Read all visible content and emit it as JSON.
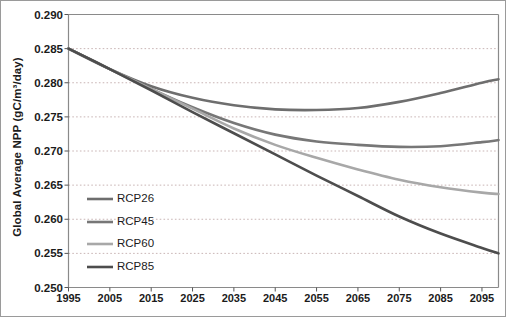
{
  "chart_data": {
    "type": "line",
    "title": "",
    "xlabel": "",
    "ylabel": "Global Average NPP (gC/m³/day)",
    "xlim": [
      1995,
      2099
    ],
    "ylim": [
      0.25,
      0.29
    ],
    "grid": true,
    "legend_position": "inside-lower-left",
    "x_ticks": [
      "1995",
      "2005",
      "2015",
      "2025",
      "2035",
      "2045",
      "2055",
      "2065",
      "2075",
      "2085",
      "2095"
    ],
    "y_ticks": [
      "0.250",
      "0.255",
      "0.260",
      "0.265",
      "0.270",
      "0.275",
      "0.280",
      "0.285",
      "0.290"
    ],
    "x": [
      1995,
      2005,
      2015,
      2025,
      2035,
      2045,
      2055,
      2065,
      2075,
      2085,
      2095,
      2099
    ],
    "series": [
      {
        "name": "RCP26",
        "color": "#6e6e6e",
        "values": [
          0.285,
          0.282,
          0.2795,
          0.2778,
          0.2767,
          0.2761,
          0.276,
          0.2763,
          0.2772,
          0.2785,
          0.28,
          0.2805
        ]
      },
      {
        "name": "RCP45",
        "color": "#777777",
        "values": [
          0.285,
          0.282,
          0.2791,
          0.2764,
          0.2741,
          0.2724,
          0.2714,
          0.2709,
          0.2706,
          0.2707,
          0.2713,
          0.2716
        ]
      },
      {
        "name": "RCP60",
        "color": "#a8a8a8",
        "values": [
          0.285,
          0.282,
          0.2791,
          0.2762,
          0.2733,
          0.2709,
          0.269,
          0.2673,
          0.2658,
          0.2647,
          0.2639,
          0.2637
        ]
      },
      {
        "name": "RCP85",
        "color": "#4d4d4d",
        "values": [
          0.285,
          0.282,
          0.2789,
          0.2757,
          0.2726,
          0.2695,
          0.2664,
          0.2634,
          0.2604,
          0.2579,
          0.2558,
          0.255
        ]
      }
    ]
  },
  "legend": {
    "items": [
      {
        "label": "RCP26"
      },
      {
        "label": "RCP45"
      },
      {
        "label": "RCP60"
      },
      {
        "label": "RCP85"
      }
    ]
  },
  "colors": {
    "plot_border": "#8a8a8a",
    "gridline": "#c9b5b5",
    "axis_text": "#1b1b1b",
    "background": "#ffffff"
  }
}
